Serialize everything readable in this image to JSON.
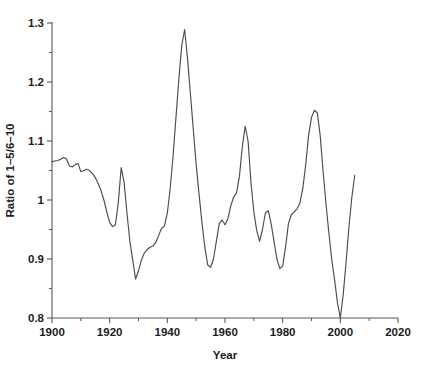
{
  "chart_data": {
    "type": "line",
    "title": "",
    "xlabel": "Year",
    "ylabel": "Ratio of 1–5/6–10",
    "xlim": [
      1900,
      2020
    ],
    "ylim": [
      0.8,
      1.3
    ],
    "grid": false,
    "legend": false,
    "x_ticks": [
      1900,
      1920,
      1940,
      1960,
      1980,
      2000,
      2020
    ],
    "x_tick_labels": [
      "1900",
      "1920",
      "1940",
      "1960",
      "1980",
      "2000",
      "2020"
    ],
    "x_minor_tick_interval": 10,
    "y_ticks": [
      0.8,
      0.9,
      1.0,
      1.1,
      1.2,
      1.3
    ],
    "y_tick_labels": [
      "0.8",
      "0.9",
      "1",
      "1.1",
      "1.2",
      "1.3"
    ],
    "y_minor_tick_interval": 0.05,
    "line_color": "#4b4b4d",
    "background_color": "#ffffff",
    "series": [
      {
        "name": "Ratio of 1–5/6–10",
        "x": [
          1900,
          1901,
          1902,
          1903,
          1904,
          1905,
          1906,
          1907,
          1908,
          1909,
          1910,
          1911,
          1912,
          1913,
          1914,
          1915,
          1916,
          1917,
          1918,
          1919,
          1920,
          1921,
          1922,
          1923,
          1924,
          1925,
          1926,
          1927,
          1928,
          1929,
          1930,
          1931,
          1932,
          1933,
          1934,
          1935,
          1936,
          1937,
          1938,
          1939,
          1940,
          1941,
          1942,
          1943,
          1944,
          1945,
          1946,
          1947,
          1948,
          1949,
          1950,
          1951,
          1952,
          1953,
          1954,
          1955,
          1956,
          1957,
          1958,
          1959,
          1960,
          1961,
          1962,
          1963,
          1964,
          1965,
          1966,
          1967,
          1968,
          1969,
          1970,
          1971,
          1972,
          1973,
          1974,
          1975,
          1976,
          1977,
          1978,
          1979,
          1980,
          1981,
          1982,
          1983,
          1984,
          1985,
          1986,
          1987,
          1988,
          1989,
          1990,
          1991,
          1992,
          1993,
          1994,
          1995,
          1996,
          1997,
          1998,
          1999,
          2000,
          2001,
          2002,
          2003,
          2004,
          2005
        ],
        "y": [
          1.065,
          1.066,
          1.067,
          1.069,
          1.072,
          1.07,
          1.058,
          1.056,
          1.06,
          1.062,
          1.048,
          1.05,
          1.052,
          1.05,
          1.045,
          1.038,
          1.028,
          1.016,
          1.0,
          0.98,
          0.962,
          0.955,
          0.958,
          0.996,
          1.055,
          1.03,
          0.978,
          0.93,
          0.898,
          0.866,
          0.88,
          0.898,
          0.91,
          0.916,
          0.92,
          0.922,
          0.928,
          0.94,
          0.952,
          0.956,
          0.978,
          1.02,
          1.075,
          1.14,
          1.205,
          1.262,
          1.289,
          1.24,
          1.18,
          1.12,
          1.06,
          1.01,
          0.962,
          0.92,
          0.89,
          0.886,
          0.9,
          0.93,
          0.96,
          0.966,
          0.958,
          0.968,
          0.99,
          1.005,
          1.012,
          1.04,
          1.09,
          1.125,
          1.1,
          1.03,
          0.98,
          0.948,
          0.93,
          0.95,
          0.978,
          0.982,
          0.96,
          0.93,
          0.9,
          0.884,
          0.888,
          0.92,
          0.96,
          0.975,
          0.98,
          0.985,
          0.995,
          1.02,
          1.06,
          1.11,
          1.14,
          1.152,
          1.148,
          1.11,
          1.05,
          0.995,
          0.945,
          0.9,
          0.865,
          0.826,
          0.8,
          0.84,
          0.895,
          0.955,
          1.005,
          1.042
        ]
      }
    ],
    "annotations": {
      "peak_1946": 1.289,
      "trough_2000": 0.8,
      "peak_1991": 1.152,
      "peak_1967": 1.125,
      "trough_1929": 0.866
    }
  },
  "layout": {
    "plot_left_px": 52,
    "plot_right_px": 398,
    "plot_top_px": 23,
    "plot_bottom_px": 318
  }
}
